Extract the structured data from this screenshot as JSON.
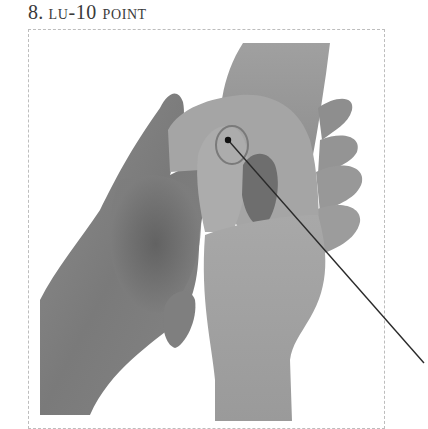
{
  "figure": {
    "number": "8.",
    "title": "LU-10 POINT",
    "title_display": "lu-10 point",
    "image_description": "Black-and-white photograph of two hands: one hand holds the other, with the thumb pressing the LU-10 acupressure point on the thenar eminence of the palm",
    "marker": {
      "point_label": "LU-10",
      "dot": {
        "x": 228,
        "y": 140
      },
      "leader_end": {
        "x": 424,
        "y": 363
      }
    },
    "colors": {
      "caption_text": "#3a3a3a",
      "frame_border": "#bdbdbd",
      "leader_line": "#2a2a2a"
    }
  }
}
